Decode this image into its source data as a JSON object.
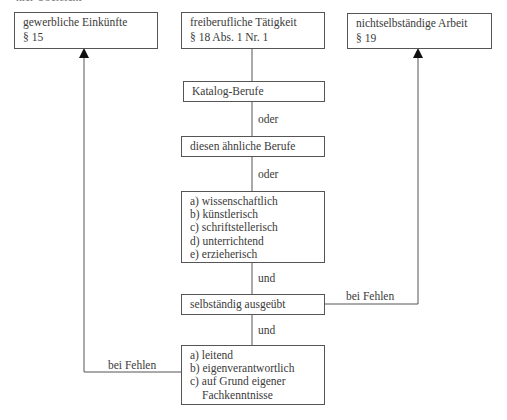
{
  "header": {
    "cut_text": "hier Übersicht"
  },
  "boxes": {
    "gewerbe": {
      "line1": "gewerbliche Einkünfte",
      "line2": "§ 15"
    },
    "freiberuf": {
      "line1": "freiberufliche Tätigkeit",
      "line2": "§ 18 Abs. 1 Nr. 1"
    },
    "nichtselbst": {
      "line1": "nichtselbständige Arbeit",
      "line2": "§ 19"
    },
    "katalog": {
      "text": "Katalog-Berufe"
    },
    "aehnlich": {
      "text": "diesen ähnliche Berufe"
    },
    "kriterien": {
      "items": [
        "a) wissenschaftlich",
        "b) künstlerisch",
        "c) schriftstellerisch",
        "d) unterrichtend",
        "e) erzieherisch"
      ]
    },
    "selbst": {
      "text": "selbständig ausgeübt"
    },
    "leitend": {
      "items": [
        "a) leitend",
        "b) eigenverantwortlich",
        "c) auf Grund eigener",
        "Fachkenntnisse"
      ]
    }
  },
  "connectors": {
    "oder1": "oder",
    "oder2": "oder",
    "und1": "und",
    "und2": "und",
    "fehlen_right": "bei Fehlen",
    "fehlen_left": "bei Fehlen"
  },
  "colors": {
    "line": "#555555",
    "text": "#3a3a3a"
  }
}
